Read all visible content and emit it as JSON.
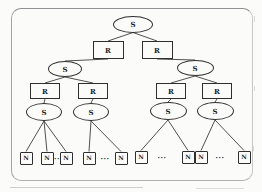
{
  "figure": {
    "title": "",
    "colors": {
      "paper": "#fbfbf9",
      "line": "#3c3c3c",
      "shape_border": "#2e2e2e",
      "frame_border": "#9e9e9a"
    },
    "nodes": [
      {
        "id": "s-root",
        "type": "ellipse",
        "label": "S",
        "x": 133,
        "y": 24,
        "w": 40,
        "h": 17
      },
      {
        "id": "r-1",
        "type": "rect",
        "label": "R",
        "x": 108,
        "y": 50,
        "w": 31,
        "h": 18
      },
      {
        "id": "r-2",
        "type": "rect",
        "label": "R",
        "x": 157,
        "y": 50,
        "w": 31,
        "h": 18
      },
      {
        "id": "s-l",
        "type": "ellipse",
        "label": "S",
        "x": 65,
        "y": 69,
        "w": 34,
        "h": 16
      },
      {
        "id": "s-r",
        "type": "ellipse",
        "label": "S",
        "x": 195,
        "y": 68,
        "w": 37,
        "h": 16
      },
      {
        "id": "r-11",
        "type": "rect",
        "label": "R",
        "x": 45,
        "y": 91,
        "w": 30,
        "h": 16
      },
      {
        "id": "r-12",
        "type": "rect",
        "label": "R",
        "x": 93,
        "y": 91,
        "w": 30,
        "h": 16
      },
      {
        "id": "r-21",
        "type": "rect",
        "label": "R",
        "x": 171,
        "y": 91,
        "w": 30,
        "h": 16
      },
      {
        "id": "r-22",
        "type": "rect",
        "label": "R",
        "x": 217,
        "y": 91,
        "w": 30,
        "h": 16
      },
      {
        "id": "s-11",
        "type": "ellipse",
        "label": "S",
        "x": 44,
        "y": 112,
        "w": 36,
        "h": 18
      },
      {
        "id": "s-12",
        "type": "ellipse",
        "label": "S",
        "x": 91,
        "y": 112,
        "w": 36,
        "h": 18
      },
      {
        "id": "s-21",
        "type": "ellipse",
        "label": "S",
        "x": 168,
        "y": 111,
        "w": 37,
        "h": 18
      },
      {
        "id": "s-22",
        "type": "ellipse",
        "label": "S",
        "x": 215,
        "y": 111,
        "w": 37,
        "h": 18
      },
      {
        "id": "n-1",
        "type": "square",
        "label": "N",
        "x": 26,
        "y": 158,
        "w": 13,
        "h": 13
      },
      {
        "id": "n-2",
        "type": "square",
        "label": "N",
        "x": 47,
        "y": 158,
        "w": 13,
        "h": 13
      },
      {
        "id": "n-3",
        "type": "square",
        "label": "N",
        "x": 66,
        "y": 158,
        "w": 13,
        "h": 13
      },
      {
        "id": "n-4",
        "type": "square",
        "label": "N",
        "x": 89,
        "y": 158,
        "w": 13,
        "h": 13
      },
      {
        "id": "n-5",
        "type": "square",
        "label": "N",
        "x": 121,
        "y": 158,
        "w": 13,
        "h": 13
      },
      {
        "id": "n-6",
        "type": "square",
        "label": "N",
        "x": 141,
        "y": 157,
        "w": 13,
        "h": 13
      },
      {
        "id": "n-7",
        "type": "square",
        "label": "N",
        "x": 188,
        "y": 157,
        "w": 13,
        "h": 13
      },
      {
        "id": "n-8",
        "type": "square",
        "label": "N",
        "x": 201,
        "y": 157,
        "w": 13,
        "h": 13
      },
      {
        "id": "n-9",
        "type": "square",
        "label": "N",
        "x": 244,
        "y": 157,
        "w": 13,
        "h": 13
      }
    ],
    "edges": [
      [
        "s-root",
        "r-1"
      ],
      [
        "s-root",
        "r-2"
      ],
      [
        "r-1",
        "s-l"
      ],
      [
        "r-2",
        "s-r"
      ],
      [
        "s-l",
        "r-11"
      ],
      [
        "s-l",
        "r-12"
      ],
      [
        "s-r",
        "r-21"
      ],
      [
        "s-r",
        "r-22"
      ],
      [
        "r-11",
        "s-11"
      ],
      [
        "r-12",
        "s-12"
      ],
      [
        "r-21",
        "s-21"
      ],
      [
        "r-22",
        "s-22"
      ],
      [
        "s-11",
        "n-1"
      ],
      [
        "s-11",
        "n-2"
      ],
      [
        "s-11",
        "n-3"
      ],
      [
        "s-12",
        "n-4"
      ],
      [
        "s-12",
        "n-5"
      ],
      [
        "s-21",
        "n-6"
      ],
      [
        "s-21",
        "n-7"
      ],
      [
        "s-22",
        "n-8"
      ],
      [
        "s-22",
        "n-9"
      ]
    ],
    "separators": [
      {
        "label": "··",
        "x": 57,
        "y": 158
      },
      {
        "label": "···",
        "x": 105,
        "y": 158
      },
      {
        "label": "···",
        "x": 162,
        "y": 157
      },
      {
        "label": "···",
        "x": 220,
        "y": 157
      }
    ]
  }
}
